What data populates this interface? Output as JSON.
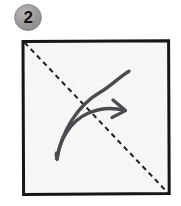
{
  "figure": {
    "kind": "origami-instruction-step",
    "step_number": "2",
    "caption": ""
  },
  "badge": {
    "label": "2",
    "shape": "circle",
    "fill_color": "#9a9a9a",
    "rim_color": "#8a8a8a",
    "text_color": "#111114",
    "diameter_px": 27
  },
  "paper": {
    "shape": "square",
    "fill_color": "#f7f7f5",
    "border_color": "#15151a",
    "border_width_px": 3,
    "x": 21,
    "y": 39,
    "width": 150,
    "height": 157
  },
  "crease_line": {
    "name": "valley-fold-crease",
    "style": "dashed",
    "color": "#1d1d22",
    "width_px": 2,
    "dash_px": 5,
    "gap_px": 4,
    "from": {
      "x": 24,
      "y": 42
    },
    "to": {
      "x": 168,
      "y": 193
    },
    "description": "dashed diagonal from top-left corner to bottom-right corner"
  },
  "fold_arrow": {
    "name": "fold-arrow",
    "color": "#4b4b53",
    "stroke_width_px": 3.2,
    "head_style": "open-chevron",
    "tail": {
      "x": 57,
      "y": 159
    },
    "apex": {
      "x": 129,
      "y": 71
    },
    "head_tip": {
      "x": 124,
      "y": 109
    },
    "description": "double-curve arrow indicating fold bottom-left corner up and over to the top-right along the diagonal crease"
  },
  "colors": {
    "page_background": "#ffffff",
    "paper_fill": "#f7f7f5",
    "ink_dark": "#15151a",
    "ink_gray": "#4b4b53",
    "badge_gray": "#9a9a9a"
  }
}
